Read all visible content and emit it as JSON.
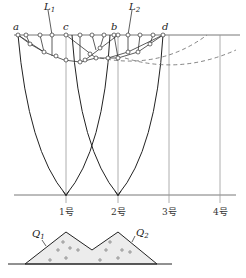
{
  "diagram": {
    "point_labels": {
      "a": "a",
      "b": "b",
      "c": "c",
      "d": "d"
    },
    "line_labels": {
      "L1": {
        "main": "L",
        "sub": "1"
      },
      "L2": {
        "main": "L",
        "sub": "2"
      }
    },
    "station_labels": [
      "1号",
      "2号",
      "3号",
      "4号"
    ],
    "pile_labels": {
      "Q1": {
        "main": "Q",
        "sub": "1"
      },
      "Q2": {
        "main": "Q",
        "sub": "2"
      }
    },
    "colors": {
      "line": "#222222",
      "grid": "#888888",
      "dashed": "#666666",
      "pile_fill": "#e6e6e6"
    }
  }
}
